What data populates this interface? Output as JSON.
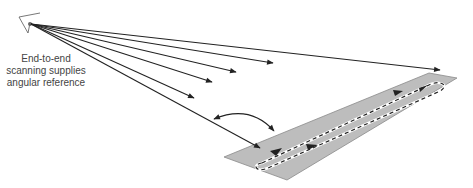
{
  "caption": {
    "lines": [
      "End-to-end",
      "scanning supplies",
      "angular reference"
    ]
  },
  "colors": {
    "runway_fill": "#bdbdbd",
    "runway_stroke": "#8a8a8a",
    "line": "#222222",
    "track_dash": "#222222",
    "track_base": "#ffffff",
    "caption": "#444444"
  },
  "diagram": {
    "origin": [
      28,
      23
    ],
    "rays_to": [
      [
        440,
        70
      ],
      [
        273,
        63
      ],
      [
        236,
        72
      ],
      [
        212,
        82
      ],
      [
        194,
        98
      ],
      [
        260,
        148
      ]
    ],
    "runway": [
      [
        224,
        157
      ],
      [
        429,
        73
      ],
      [
        457,
        78
      ],
      [
        287,
        180
      ]
    ],
    "angle_arc": {
      "from": [
        213,
        118
      ],
      "to": [
        275,
        132
      ]
    }
  }
}
